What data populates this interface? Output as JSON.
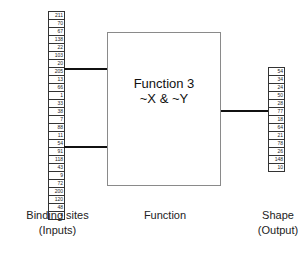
{
  "diagram": {
    "inputs_top": [
      "211",
      "70",
      "67",
      "138",
      "22",
      "103",
      "20",
      "205",
      "13",
      "66",
      "1",
      "33",
      "38"
    ],
    "inputs_bottom": [
      "7",
      "88",
      "11",
      "54",
      "91",
      "118",
      "43",
      "9",
      "72",
      "200",
      "120",
      "48",
      "4"
    ],
    "output": [
      "54",
      "34",
      "24",
      "50",
      "28",
      "77",
      "18",
      "64",
      "21",
      "78",
      "26",
      "148",
      "10"
    ],
    "function": {
      "title": "Function 3",
      "expression": "~X & ~Y"
    },
    "labels": {
      "inputs_line1": "Binding sites",
      "inputs_line2": "(Inputs)",
      "function": "Function",
      "output_line1": "Shape",
      "output_line2": "(Output)"
    },
    "colors": {
      "line": "#111111",
      "box_border": "#8a8a8a",
      "cell_border": "#333333"
    }
  }
}
